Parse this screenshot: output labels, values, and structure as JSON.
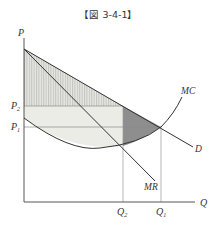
{
  "figure": {
    "title": "【図 3-4-1】"
  },
  "axes": {
    "y_label": "P",
    "x_label": "Q"
  },
  "curves": {
    "mc": "MC",
    "demand": "D",
    "mr": "MR"
  },
  "price_levels": {
    "p2": "P",
    "p2_sub": "2",
    "p1": "P",
    "p1_sub": "1"
  },
  "quantity_levels": {
    "q2": "Q",
    "q2_sub": "2",
    "q1": "Q",
    "q1_sub": "1"
  },
  "colors": {
    "line": "#333333",
    "guide": "#999999",
    "light_fill": "#ececE6",
    "dark_fill": "#8c8c8c",
    "hatch": "#aaaaaa"
  }
}
